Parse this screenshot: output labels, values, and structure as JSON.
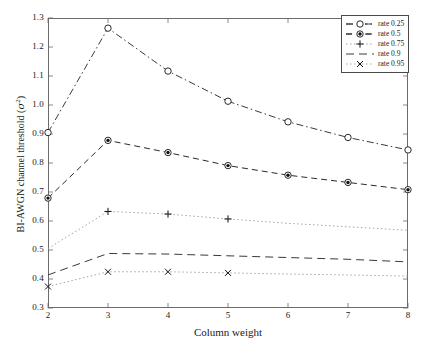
{
  "chart_data": {
    "type": "line",
    "title": "",
    "xlabel": "Column weight",
    "ylabel": "BI-AWGN channel threshold (σ²)",
    "ylabel_text": "BI-AWGN channel threshold (",
    "ylabel_symbol": "σ",
    "ylabel_exponent": "2",
    "ylabel_close": ")",
    "xlim": [
      2,
      8
    ],
    "ylim": [
      0.3,
      1.3
    ],
    "xticks": [
      "2",
      "3",
      "4",
      "5",
      "6",
      "7",
      "8"
    ],
    "yticks": [
      "0.3",
      "0.4",
      "0.5",
      "0.6",
      "0.7",
      "0.8",
      "0.9",
      "1.0",
      "1.1",
      "1.2",
      "1.3"
    ],
    "grid": false,
    "legend_position": "upper-right",
    "x": [
      2,
      3,
      4,
      5,
      6,
      7,
      8
    ],
    "series": [
      {
        "name": "rate 0.25",
        "label": "rate 0.25",
        "marker": "circle-open",
        "linestyle": "dash-dot",
        "color": "#3a3a3a",
        "marker_x": [
          2,
          3,
          4,
          5,
          6,
          7,
          8
        ],
        "values": [
          0.905,
          1.265,
          1.117,
          1.013,
          0.942,
          0.888,
          0.845
        ]
      },
      {
        "name": "rate 0.5",
        "label": "rate 0.5",
        "marker": "circle-filled",
        "linestyle": "dashed",
        "color": "#2a2a2a",
        "marker_x": [
          2,
          3,
          4,
          5,
          6,
          7,
          8
        ],
        "values": [
          0.679,
          0.878,
          0.836,
          0.791,
          0.758,
          0.733,
          0.708
        ]
      },
      {
        "name": "rate 0.75",
        "label": "rate 0.75",
        "marker": "plus",
        "linestyle": "dotted",
        "color": "#9a9a9a",
        "marker_x": [
          3,
          4,
          5
        ],
        "values": [
          0.505,
          0.633,
          0.624,
          0.607,
          0.592,
          0.58,
          0.568
        ]
      },
      {
        "name": "rate 0.9",
        "label": "rate 0.9",
        "marker": "none",
        "linestyle": "dashed-long",
        "color": "#3a3a3a",
        "marker_x": [],
        "values": [
          0.414,
          0.488,
          0.486,
          0.48,
          0.474,
          0.468,
          0.459
        ]
      },
      {
        "name": "rate 0.95",
        "label": "rate 0.95",
        "marker": "cross",
        "linestyle": "dotted",
        "color": "#9a9a9a",
        "marker_x": [
          2,
          3,
          4,
          5
        ],
        "values": [
          0.374,
          0.425,
          0.425,
          0.421,
          0.417,
          0.414,
          0.41
        ]
      }
    ]
  }
}
